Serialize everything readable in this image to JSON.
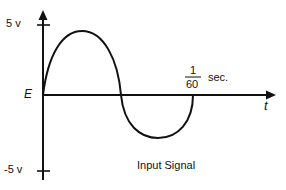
{
  "diagram": {
    "title": "Input Signal",
    "y_axis": {
      "origin_label": "E",
      "max_label": "5 v",
      "min_label": "-5 v"
    },
    "x_axis": {
      "label": "t",
      "period_numerator": "1",
      "period_denominator": "60",
      "period_unit": "sec."
    },
    "waveform": {
      "type": "sine",
      "cycles": 1,
      "amplitude_v": 5,
      "period_s": "1/60",
      "stroke_color": "#111111"
    }
  }
}
